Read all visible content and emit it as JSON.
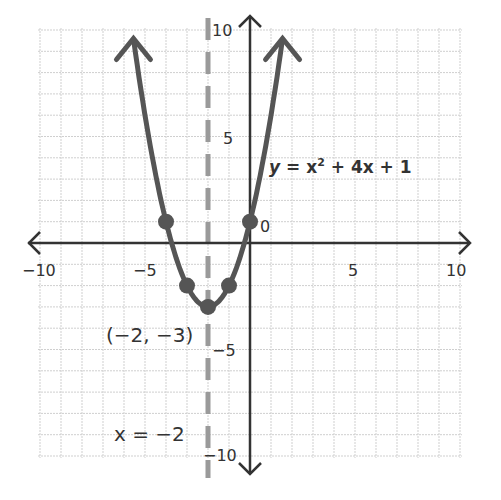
{
  "chart_data": {
    "type": "line",
    "title": "",
    "xlabel": "",
    "ylabel": "",
    "xlim": [
      -10,
      10
    ],
    "ylim": [
      -10,
      10
    ],
    "grid": true,
    "x_ticks": [
      -10,
      -5,
      5,
      10
    ],
    "x_tick_labels": [
      "−10",
      "−5",
      "5",
      "10"
    ],
    "y_ticks": [
      10,
      5,
      0,
      -5,
      -10
    ],
    "y_tick_labels": [
      "10",
      "5",
      "0",
      "−5",
      "−10"
    ],
    "series": [
      {
        "name": "y = x² + 4x + 1",
        "function": "x^2 + 4x + 1",
        "points": [
          {
            "x": -4,
            "y": 1
          },
          {
            "x": -3,
            "y": -2
          },
          {
            "x": -2,
            "y": -3
          },
          {
            "x": -1,
            "y": -2
          },
          {
            "x": 0,
            "y": 1
          }
        ]
      }
    ],
    "axis_of_symmetry": {
      "x": -2,
      "label": "x = −2",
      "style": "dashed"
    },
    "vertex": {
      "x": -2,
      "y": -3,
      "label": "(−2, −3)"
    },
    "annotations": [
      "y = x² + 4x + 1",
      "(−2, −3)",
      "x = −2"
    ]
  },
  "labels": {
    "equation_y": "y",
    "equation_rest": " = x",
    "equation_exp": "2",
    "equation_tail": " + 4x + 1",
    "vertex": "(−2, −3)",
    "axis_line": "x = −2",
    "x_neg10": "−10",
    "x_neg5": "−5",
    "x_5": "5",
    "x_10": "10",
    "y_10": "10",
    "y_5": "5",
    "y_0": "0",
    "y_neg5": "−5",
    "y_neg10": "−10"
  },
  "colors": {
    "curve": "#555555",
    "axis": "#333333",
    "grid": "#cfcfcf",
    "dashed": "#9a9a9a",
    "text": "#333333"
  }
}
